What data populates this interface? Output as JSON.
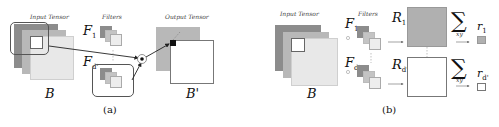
{
  "panel_a": {
    "input_label": "Input Tensor",
    "filters_label": "Filters",
    "output_label": "Output Tensor",
    "f1": "F",
    "f1_sub": "1",
    "fd": "F",
    "fd_sub": "d'",
    "b_label": "B",
    "b_prime_label": "B'",
    "caption": "(a)"
  },
  "panel_b": {
    "input_label": "Input Tensor",
    "filters_label": "Filters",
    "f1": "F",
    "f1_sub": "1",
    "fd": "F",
    "fd_sub": "d'",
    "b_label": "B",
    "r1": "R",
    "r1_sub": "1",
    "rd": "R",
    "rd_sub": "d'",
    "sum_symbol": "∑",
    "sum_sub": "xy",
    "small_r1": "r",
    "small_r1_sub": "1",
    "small_rd": "r",
    "small_rd_sub": "d'",
    "caption": "(b)"
  },
  "colors": {
    "layer_dark": "#8c8c8c",
    "layer_mid": "#b8b8b8",
    "layer_light": "#e6e6e6",
    "r1_fill": "#b0b0b0",
    "outline": "#555555"
  }
}
